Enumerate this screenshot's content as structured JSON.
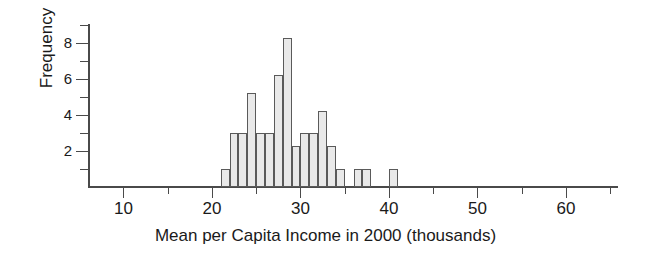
{
  "chart_data": {
    "type": "bar",
    "title": "",
    "subtitle": "",
    "xlabel": "Mean per Capita Income in 2000 (thousands)",
    "ylabel": "Frequency",
    "xlim": [
      6,
      65
    ],
    "ylim": [
      0,
      9
    ],
    "grid": false,
    "legend": null,
    "bin_width": 1,
    "x_ticks": [
      10,
      20,
      30,
      40,
      50,
      60
    ],
    "x_tick_labels": [
      "10",
      "20",
      "30",
      "40",
      "50",
      "60"
    ],
    "x_minor_ticks": [
      15,
      25,
      35,
      45,
      55,
      65
    ],
    "y_ticks": [
      2,
      4,
      6,
      8
    ],
    "y_tick_labels": [
      "2",
      "4",
      "6",
      "8"
    ],
    "y_minor_ticks": [
      1,
      3,
      5,
      7,
      9
    ],
    "categories": [
      21,
      22,
      23,
      24,
      25,
      26,
      27,
      28,
      29,
      30,
      31,
      32,
      33,
      34,
      36,
      37,
      40
    ],
    "values": [
      1,
      3,
      3,
      5.2,
      3,
      3,
      6.2,
      8.3,
      2.3,
      3,
      3,
      4.2,
      2.3,
      1,
      1,
      1,
      1
    ],
    "bars": [
      {
        "bin_start": 21,
        "bin_end": 22,
        "frequency": 1
      },
      {
        "bin_start": 22,
        "bin_end": 23,
        "frequency": 3
      },
      {
        "bin_start": 23,
        "bin_end": 24,
        "frequency": 3
      },
      {
        "bin_start": 24,
        "bin_end": 25,
        "frequency": 5.2
      },
      {
        "bin_start": 25,
        "bin_end": 26,
        "frequency": 3
      },
      {
        "bin_start": 26,
        "bin_end": 27,
        "frequency": 3
      },
      {
        "bin_start": 27,
        "bin_end": 28,
        "frequency": 6.2
      },
      {
        "bin_start": 28,
        "bin_end": 29,
        "frequency": 8.3
      },
      {
        "bin_start": 29,
        "bin_end": 30,
        "frequency": 2.3
      },
      {
        "bin_start": 30,
        "bin_end": 31,
        "frequency": 3
      },
      {
        "bin_start": 31,
        "bin_end": 32,
        "frequency": 3
      },
      {
        "bin_start": 32,
        "bin_end": 33,
        "frequency": 4.2
      },
      {
        "bin_start": 33,
        "bin_end": 34,
        "frequency": 2.3
      },
      {
        "bin_start": 34,
        "bin_end": 35,
        "frequency": 1
      },
      {
        "bin_start": 36,
        "bin_end": 37,
        "frequency": 1
      },
      {
        "bin_start": 37,
        "bin_end": 38,
        "frequency": 1
      },
      {
        "bin_start": 40,
        "bin_end": 41,
        "frequency": 1
      }
    ],
    "colors": {
      "bar_fill": "#e9e9e9",
      "bar_stroke": "#5a5a5a",
      "axis": "#4a4a4a",
      "text": "#1a1a1a",
      "background": "#ffffff"
    }
  }
}
